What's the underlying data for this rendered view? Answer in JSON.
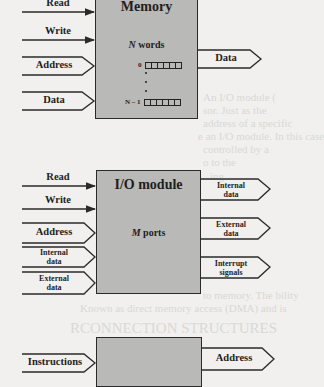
{
  "figure": {
    "memory": {
      "title": "Memory",
      "capacity_label": "N words",
      "first_index": "0",
      "last_index": "N – 1",
      "inputs": [
        {
          "label": "Read",
          "kind": "control"
        },
        {
          "label": "Write",
          "kind": "control"
        },
        {
          "label": "Address",
          "kind": "data"
        },
        {
          "label": "Data",
          "kind": "data"
        }
      ],
      "outputs": [
        {
          "label": "Data",
          "kind": "data"
        }
      ]
    },
    "io_module": {
      "title": "I/O module",
      "capacity_label": "M ports",
      "inputs": [
        {
          "label": "Read",
          "kind": "control"
        },
        {
          "label": "Write",
          "kind": "control"
        },
        {
          "label": "Address",
          "kind": "data"
        },
        {
          "label": "Internal data",
          "line1": "Internal",
          "line2": "data",
          "kind": "data"
        },
        {
          "label": "External data",
          "line1": "External",
          "line2": "data",
          "kind": "data"
        }
      ],
      "outputs": [
        {
          "label": "Internal data",
          "line1": "Internal",
          "line2": "data",
          "kind": "data"
        },
        {
          "label": "External data",
          "line1": "External",
          "line2": "data",
          "kind": "data"
        },
        {
          "label": "Interrupt signals",
          "line1": "Interrupt",
          "line2": "signals",
          "kind": "data"
        }
      ]
    },
    "cpu": {
      "inputs": [
        {
          "label": "Instructions",
          "kind": "data"
        }
      ],
      "outputs": [
        {
          "label": "Address",
          "kind": "data"
        }
      ]
    }
  },
  "bleed_through_text": [
    "An I/O module (",
    "sor. Just as the",
    "address of a specific",
    "e an I/O module. In this case",
    "controlled by a",
    "o to the",
    "ing",
    "e",
    "to memory. The bility",
    "Known as direct memory access (DMA) and is",
    "RCONNECTION STRUCTURES"
  ],
  "colors": {
    "page": "#f1f0ee",
    "box_fill": "#b9b9b7",
    "stroke": "#2a2a2a",
    "ghost_text": "#d9d8d5"
  }
}
